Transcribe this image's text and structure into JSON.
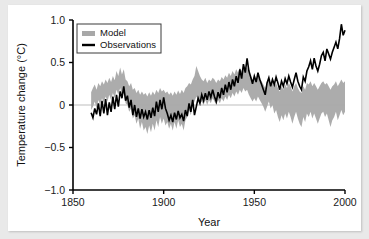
{
  "chart_data": {
    "type": "line",
    "title": "",
    "xlabel": "Year",
    "ylabel": "Temperature change (°C)",
    "xlim": [
      1850,
      2000
    ],
    "ylim": [
      -1.0,
      1.0
    ],
    "xticks": [
      "1850",
      "1900",
      "1950",
      "2000"
    ],
    "xtick_values": [
      1850,
      1900,
      1950,
      2000
    ],
    "yticks": [
      "1.0",
      "0.5",
      "0",
      "−0.5",
      "−1.0"
    ],
    "ytick_values": [
      1.0,
      0.5,
      0,
      -0.5,
      -1.0
    ],
    "grid": false,
    "zero_line": true,
    "legend_position": "top-left",
    "legend": [
      {
        "label": "Model",
        "type": "band",
        "color": "#a8a8a8"
      },
      {
        "label": "Observations",
        "type": "line",
        "color": "#000000"
      }
    ],
    "x": [
      1860,
      1861,
      1862,
      1863,
      1864,
      1865,
      1866,
      1867,
      1868,
      1869,
      1870,
      1871,
      1872,
      1873,
      1874,
      1875,
      1876,
      1877,
      1878,
      1879,
      1880,
      1881,
      1882,
      1883,
      1884,
      1885,
      1886,
      1887,
      1888,
      1889,
      1890,
      1891,
      1892,
      1893,
      1894,
      1895,
      1896,
      1897,
      1898,
      1899,
      1900,
      1901,
      1902,
      1903,
      1904,
      1905,
      1906,
      1907,
      1908,
      1909,
      1910,
      1911,
      1912,
      1913,
      1914,
      1915,
      1916,
      1917,
      1918,
      1919,
      1920,
      1921,
      1922,
      1923,
      1924,
      1925,
      1926,
      1927,
      1928,
      1929,
      1930,
      1931,
      1932,
      1933,
      1934,
      1935,
      1936,
      1937,
      1938,
      1939,
      1940,
      1941,
      1942,
      1943,
      1944,
      1945,
      1946,
      1947,
      1948,
      1949,
      1950,
      1951,
      1952,
      1953,
      1954,
      1955,
      1956,
      1957,
      1958,
      1959,
      1960,
      1961,
      1962,
      1963,
      1964,
      1965,
      1966,
      1967,
      1968,
      1969,
      1970,
      1971,
      1972,
      1973,
      1974,
      1975,
      1976,
      1977,
      1978,
      1979,
      1980,
      1981,
      1982,
      1983,
      1984,
      1985,
      1986,
      1987,
      1988,
      1989,
      1990,
      1991,
      1992,
      1993,
      1994,
      1995,
      1996,
      1997,
      1998,
      1999,
      2000
    ],
    "series": [
      {
        "name": "Observations",
        "color": "#000000",
        "values": [
          -0.09,
          -0.15,
          -0.04,
          -0.11,
          0.02,
          -0.13,
          0.05,
          -0.1,
          0.07,
          -0.12,
          0.03,
          -0.08,
          0.1,
          -0.05,
          0.12,
          -0.02,
          0.16,
          0.08,
          0.22,
          0.05,
          0.11,
          -0.03,
          0.06,
          -0.12,
          0.0,
          -0.14,
          -0.04,
          -0.16,
          -0.05,
          -0.14,
          -0.08,
          -0.17,
          -0.06,
          -0.15,
          -0.03,
          -0.13,
          0.04,
          -0.08,
          0.06,
          -0.05,
          0.09,
          -0.04,
          -0.1,
          -0.18,
          -0.12,
          -0.2,
          -0.09,
          -0.17,
          -0.07,
          -0.15,
          -0.11,
          -0.19,
          -0.06,
          -0.13,
          0.02,
          -0.08,
          0.06,
          -0.12,
          -0.02,
          0.08,
          0.02,
          0.12,
          0.05,
          0.14,
          0.06,
          0.16,
          0.09,
          0.18,
          0.1,
          0.04,
          0.15,
          0.08,
          0.2,
          0.12,
          0.24,
          0.15,
          0.27,
          0.18,
          0.3,
          0.22,
          0.34,
          0.26,
          0.42,
          0.31,
          0.48,
          0.38,
          0.55,
          0.4,
          0.33,
          0.25,
          0.34,
          0.27,
          0.38,
          0.3,
          0.24,
          0.18,
          0.12,
          0.26,
          0.32,
          0.22,
          0.3,
          0.24,
          0.33,
          0.26,
          0.18,
          0.28,
          0.22,
          0.31,
          0.25,
          0.34,
          0.27,
          0.21,
          0.3,
          0.38,
          0.28,
          0.22,
          0.18,
          0.33,
          0.28,
          0.4,
          0.45,
          0.52,
          0.42,
          0.55,
          0.46,
          0.4,
          0.48,
          0.58,
          0.62,
          0.52,
          0.66,
          0.6,
          0.54,
          0.62,
          0.68,
          0.74,
          0.66,
          0.78,
          0.95,
          0.82,
          0.88
        ]
      },
      {
        "name": "Model band upper",
        "color": "#a8a8a8",
        "values": [
          0.15,
          0.2,
          0.24,
          0.18,
          0.26,
          0.22,
          0.28,
          0.24,
          0.3,
          0.26,
          0.32,
          0.27,
          0.34,
          0.29,
          0.4,
          0.34,
          0.44,
          0.36,
          0.42,
          0.3,
          0.28,
          0.22,
          0.26,
          0.18,
          0.2,
          0.14,
          0.18,
          0.12,
          0.16,
          0.12,
          0.14,
          0.1,
          0.15,
          0.11,
          0.16,
          0.12,
          0.18,
          0.14,
          0.2,
          0.16,
          0.18,
          0.14,
          0.16,
          0.12,
          0.15,
          0.11,
          0.16,
          0.12,
          0.17,
          0.13,
          0.18,
          0.14,
          0.2,
          0.22,
          0.26,
          0.24,
          0.3,
          0.34,
          0.46,
          0.4,
          0.34,
          0.3,
          0.28,
          0.32,
          0.26,
          0.3,
          0.28,
          0.32,
          0.3,
          0.26,
          0.3,
          0.28,
          0.33,
          0.3,
          0.35,
          0.32,
          0.38,
          0.34,
          0.4,
          0.36,
          0.42,
          0.38,
          0.44,
          0.4,
          0.46,
          0.42,
          0.44,
          0.38,
          0.34,
          0.3,
          0.34,
          0.3,
          0.36,
          0.32,
          0.28,
          0.24,
          0.2,
          0.26,
          0.3,
          0.24,
          0.28,
          0.22,
          0.26,
          0.2,
          0.16,
          0.22,
          0.18,
          0.24,
          0.2,
          0.26,
          0.22,
          0.16,
          0.22,
          0.26,
          0.2,
          0.16,
          0.14,
          0.22,
          0.18,
          0.26,
          0.24,
          0.28,
          0.22,
          0.26,
          0.22,
          0.18,
          0.22,
          0.26,
          0.28,
          0.24,
          0.26,
          0.22,
          0.18,
          0.22,
          0.24,
          0.28,
          0.22,
          0.26,
          0.3,
          0.26,
          0.28
        ]
      },
      {
        "name": "Model band lower",
        "color": "#a8a8a8",
        "values": [
          -0.06,
          -0.02,
          0.04,
          -0.04,
          0.06,
          0.0,
          0.08,
          0.02,
          0.1,
          0.04,
          0.12,
          0.06,
          0.14,
          0.08,
          0.18,
          0.12,
          0.2,
          0.1,
          0.14,
          0.02,
          0.0,
          -0.08,
          -0.04,
          -0.16,
          -0.12,
          -0.22,
          -0.16,
          -0.28,
          -0.2,
          -0.3,
          -0.26,
          -0.34,
          -0.24,
          -0.32,
          -0.22,
          -0.3,
          -0.18,
          -0.26,
          -0.14,
          -0.22,
          -0.16,
          -0.24,
          -0.2,
          -0.28,
          -0.22,
          -0.3,
          -0.2,
          -0.28,
          -0.18,
          -0.26,
          -0.22,
          -0.3,
          -0.18,
          -0.14,
          -0.06,
          -0.12,
          0.0,
          0.04,
          0.1,
          0.06,
          0.02,
          0.04,
          0.0,
          0.06,
          0.0,
          0.06,
          0.02,
          0.08,
          0.04,
          0.0,
          0.06,
          0.02,
          0.08,
          0.04,
          0.1,
          0.06,
          0.12,
          0.08,
          0.14,
          0.1,
          0.16,
          0.12,
          0.18,
          0.14,
          0.2,
          0.16,
          0.18,
          0.12,
          0.08,
          0.04,
          0.08,
          0.04,
          0.1,
          0.06,
          0.02,
          -0.02,
          -0.08,
          -0.02,
          0.04,
          -0.04,
          0.0,
          -0.1,
          -0.06,
          -0.14,
          -0.2,
          -0.12,
          -0.18,
          -0.1,
          -0.16,
          -0.08,
          -0.14,
          -0.22,
          -0.14,
          -0.08,
          -0.16,
          -0.22,
          -0.26,
          -0.14,
          -0.2,
          -0.1,
          -0.14,
          -0.08,
          -0.16,
          -0.1,
          -0.16,
          -0.22,
          -0.16,
          -0.1,
          -0.08,
          -0.14,
          -0.1,
          -0.18,
          -0.26,
          -0.18,
          -0.14,
          -0.08,
          -0.18,
          -0.12,
          -0.06,
          -0.12,
          -0.08
        ]
      }
    ]
  }
}
